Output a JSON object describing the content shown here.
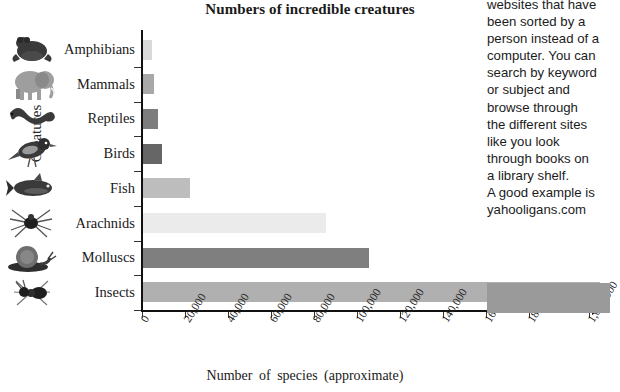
{
  "chart_data": {
    "type": "bar",
    "orientation": "horizontal",
    "title": "Numbers of incredible creatures",
    "xlabel": "Number  of  species  (approximate)",
    "ylabel": "Creatures",
    "categories": [
      "Amphibians",
      "Mammals",
      "Reptiles",
      "Birds",
      "Fish",
      "Arachnids",
      "Molluscs",
      "Insects"
    ],
    "values": [
      4000,
      5000,
      7000,
      9000,
      22000,
      85000,
      105000,
      1000000
    ],
    "xlim": [
      0,
      1000000
    ],
    "xticks": [
      "0",
      "20,000",
      "40,000",
      "60,000",
      "80,000",
      "100,000",
      "120,000",
      "140,000",
      "160,000",
      "180,000",
      "1,000,000"
    ],
    "xtick_values": [
      0,
      20000,
      40000,
      60000,
      80000,
      100000,
      120000,
      140000,
      160000,
      180000,
      1000000
    ],
    "axis_break": "//",
    "grid": false,
    "legend": false,
    "bar_colors": [
      "#d9d9d9",
      "#a8a8a8",
      "#7d7d7d",
      "#666666",
      "#bdbdbd",
      "#ebebeb",
      "#7f7f7f",
      "#b0b0b0"
    ],
    "icons": [
      "frog-icon",
      "elephant-icon",
      "snake-icon",
      "bird-icon",
      "fish-icon",
      "spider-icon",
      "snail-icon",
      "ant-icon"
    ]
  },
  "side_panel": {
    "lines": [
      "websites that have",
      "been sorted by a",
      "person instead of a",
      "computer. You can",
      "search by keyword",
      "or subject and",
      "browse through",
      "the different sites",
      "like you look",
      "through books on",
      "a library shelf.",
      "A good example is",
      "yahooligans.com"
    ]
  }
}
